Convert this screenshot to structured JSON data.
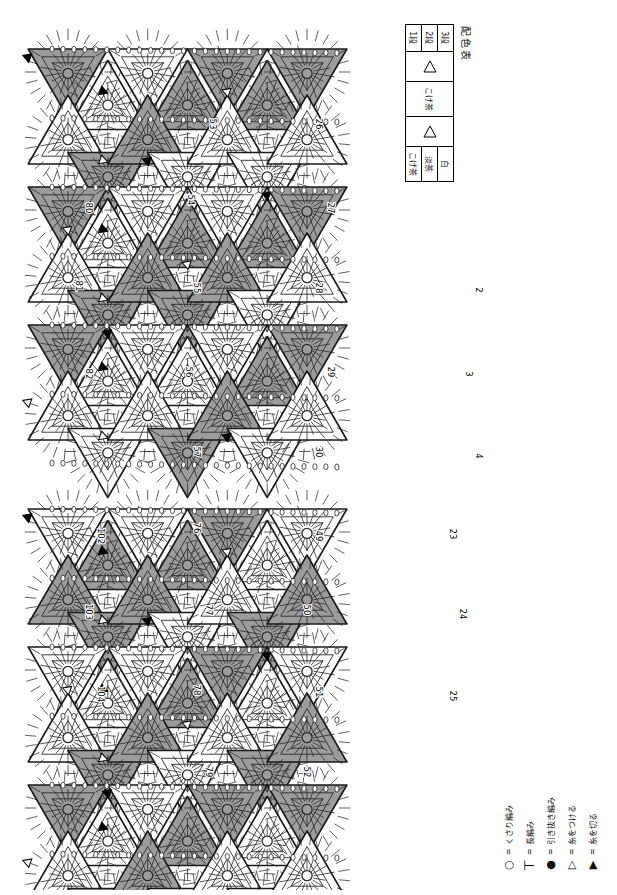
{
  "page": {
    "width": 617,
    "height": 895,
    "background": "#ffffff"
  },
  "color_chart": {
    "title": "配色表",
    "columns": [
      "段",
      "色A",
      "色B"
    ],
    "rows": [
      {
        "row_label": "3段",
        "swatch_a": "triangle-filled",
        "swatch_b": "triangle-outline",
        "name_a": "こげ茶",
        "name_b": "白"
      },
      {
        "row_label": "2段",
        "swatch_a": "triangle-filled",
        "swatch_b": "triangle-outline",
        "name_a": "こげ茶",
        "name_b": "淡茶"
      },
      {
        "row_label": "1段",
        "swatch_a": "triangle-filled",
        "swatch_b": "triangle-outline",
        "name_a": "こげ茶",
        "name_b": "こげ茶"
      }
    ],
    "group_left_name": "こげ茶",
    "group_right_names": [
      "白",
      "淡茶",
      "こげ茶"
    ]
  },
  "legend": {
    "items": [
      {
        "symbol": "○",
        "icon": "chain-stitch-icon",
        "eq": "=",
        "label": "くさり編み"
      },
      {
        "symbol": "丅",
        "icon": "double-crochet-icon",
        "eq": "=",
        "label": "長編み"
      },
      {
        "symbol": "●",
        "icon": "slip-stitch-icon",
        "eq": "=",
        "label": "引き抜き編み"
      },
      {
        "symbol": "▷",
        "icon": "join-yarn-icon",
        "eq": "=",
        "label": "糸をつける"
      },
      {
        "symbol": "▶",
        "icon": "cut-yarn-icon",
        "eq": "=",
        "label": "糸を切る"
      }
    ]
  },
  "colors": {
    "dark": "#9c9c9c",
    "dark_stroke": "#2b2b2b",
    "light": "#ffffff",
    "pale": "#ececec",
    "line": "#1a1a1a",
    "paper": "#ffffff"
  },
  "clusters": [
    {
      "id": "cluster-right",
      "name": "right-hexagon-cluster",
      "origin_x": 30,
      "origin_y": 38,
      "motifs": [
        {
          "num": "53",
          "cx": 212,
          "cy": 124,
          "rot": 90,
          "shade": "light"
        },
        {
          "num": "54",
          "cx": 190,
          "cy": 200,
          "rot": 90,
          "shade": "dark"
        },
        {
          "num": "55",
          "cx": 196,
          "cy": 288,
          "rot": 90,
          "shade": "dark"
        },
        {
          "num": "56",
          "cx": 188,
          "cy": 372,
          "rot": 90,
          "shade": "dark"
        },
        {
          "num": "57",
          "cx": 196,
          "cy": 452,
          "rot": 90,
          "shade": "dark"
        },
        {
          "num": "80",
          "cx": 88,
          "cy": 208,
          "rot": 90,
          "shade": "light"
        },
        {
          "num": "81",
          "cx": 78,
          "cy": 286,
          "rot": 90,
          "shade": "dark"
        },
        {
          "num": "82",
          "cx": 88,
          "cy": 374,
          "rot": 90,
          "shade": "light"
        },
        {
          "num": "26",
          "cx": 318,
          "cy": 124,
          "rot": 90,
          "shade": "dark"
        },
        {
          "num": "27",
          "cx": 330,
          "cy": 208,
          "rot": 90,
          "shade": "light"
        },
        {
          "num": "28",
          "cx": 318,
          "cy": 288,
          "rot": 90,
          "shade": "dark"
        },
        {
          "num": "29",
          "cx": 330,
          "cy": 372,
          "rot": 90,
          "shade": "light"
        },
        {
          "num": "30",
          "cx": 318,
          "cy": 452,
          "rot": 90,
          "shade": "dark"
        },
        {
          "num": "2",
          "cx": 478,
          "cy": 290,
          "rot": 90,
          "shade": "light"
        },
        {
          "num": "3",
          "cx": 468,
          "cy": 374,
          "rot": 90,
          "shade": "light"
        },
        {
          "num": "4",
          "cx": 478,
          "cy": 456,
          "rot": 90,
          "shade": "light"
        }
      ]
    },
    {
      "id": "cluster-left",
      "name": "left-hexagon-cluster",
      "origin_x": 30,
      "origin_y": 498,
      "motifs": [
        {
          "num": "102",
          "cx": 100,
          "cy": 536,
          "rot": 90,
          "shade": "light"
        },
        {
          "num": "103",
          "cx": 88,
          "cy": 612,
          "rot": 90,
          "shade": "dark"
        },
        {
          "num": "104",
          "cx": 100,
          "cy": 694,
          "rot": 90,
          "shade": "light"
        },
        {
          "num": "76",
          "cx": 196,
          "cy": 528,
          "rot": 90,
          "shade": "dark"
        },
        {
          "num": "77",
          "cx": 208,
          "cy": 610,
          "rot": 90,
          "shade": "light"
        },
        {
          "num": "78",
          "cx": 196,
          "cy": 690,
          "rot": 90,
          "shade": "dark"
        },
        {
          "num": "79",
          "cx": 208,
          "cy": 772,
          "rot": 90,
          "shade": "light"
        },
        {
          "num": "49",
          "cx": 318,
          "cy": 536,
          "rot": 90,
          "shade": "dark"
        },
        {
          "num": "50",
          "cx": 306,
          "cy": 610,
          "rot": 90,
          "shade": "dark"
        },
        {
          "num": "51",
          "cx": 318,
          "cy": 692,
          "rot": 90,
          "shade": "light"
        },
        {
          "num": "52",
          "cx": 306,
          "cy": 772,
          "rot": 90,
          "shade": "dark"
        },
        {
          "num": "23",
          "cx": 452,
          "cy": 534,
          "rot": 90,
          "shade": "dark"
        },
        {
          "num": "24",
          "cx": 462,
          "cy": 614,
          "rot": 90,
          "shade": "light"
        },
        {
          "num": "25",
          "cx": 452,
          "cy": 696,
          "rot": 90,
          "shade": "dark"
        }
      ]
    }
  ]
}
